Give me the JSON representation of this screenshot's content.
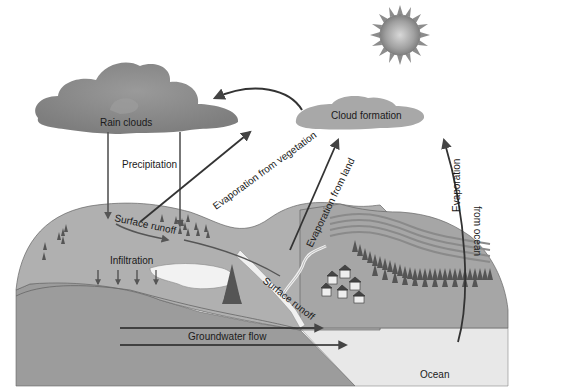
{
  "diagram": {
    "labels": {
      "rain_clouds": "Rain clouds",
      "cloud_formation": "Cloud formation",
      "precipitation": "Precipitation",
      "evap_vegetation": "Evaporation from vegetation",
      "evap_land": "Evaporation from land",
      "evap_ocean_1": "Evaporation",
      "evap_ocean_2": "from ocean",
      "surface_runoff_1": "Surface runoff",
      "surface_runoff_2": "Surface runoff",
      "infiltration": "Infiltration",
      "groundwater_flow": "Groundwater flow",
      "ocean": "Ocean"
    },
    "icons": [
      "sun-icon",
      "cloud-icon",
      "tree-icon",
      "house-icon",
      "arrow-icon"
    ],
    "colors": {
      "land": "#a9a9a9",
      "land_top": "#b4b4b4",
      "subsoil": "#999999",
      "ocean": "#e6e6e6",
      "lake": "#f2f2f2",
      "cloud_dark": "#8a8a8a",
      "cloud_light": "#b8b8b8",
      "arrow": "#444444",
      "sun": "#9a9a9a"
    }
  }
}
